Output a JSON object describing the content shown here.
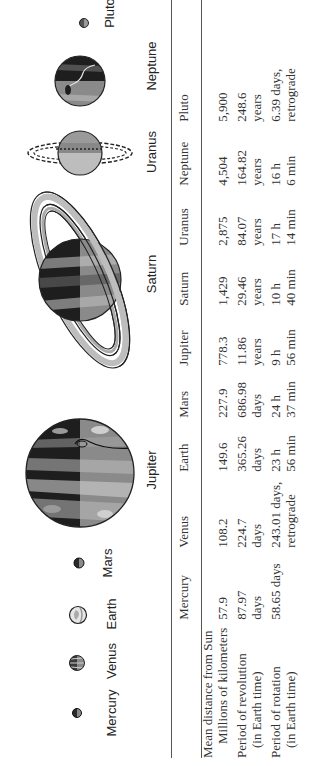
{
  "diagram": {
    "title_labels": {
      "mercury": "Mercury",
      "venus": "Venus",
      "earth": "Earth",
      "mars": "Mars",
      "jupiter": "Jupiter",
      "saturn": "Saturn",
      "uranus": "Uranus",
      "neptune": "Neptune",
      "pluto": "Pluto"
    },
    "orientation": "rotated 90 degrees counter-clockwise"
  },
  "table": {
    "columns": [
      "",
      "Mercury",
      "Venus",
      "Earth",
      "Mars",
      "Jupiter",
      "Saturn",
      "Uranus",
      "Neptune",
      "Pluto"
    ],
    "rows": [
      {
        "label_line1": "Mean distance from Sun",
        "label_line2": "Millions of kilometers",
        "values": [
          {
            "l1": "57.9",
            "l2": ""
          },
          {
            "l1": "108.2",
            "l2": ""
          },
          {
            "l1": "149.6",
            "l2": ""
          },
          {
            "l1": "227.9",
            "l2": ""
          },
          {
            "l1": "778.3",
            "l2": ""
          },
          {
            "l1": "1,429",
            "l2": ""
          },
          {
            "l1": "2,875",
            "l2": ""
          },
          {
            "l1": "4,504",
            "l2": ""
          },
          {
            "l1": "5,900",
            "l2": ""
          }
        ]
      },
      {
        "label_line1": "Period of revolution",
        "label_line2": "(in Earth time)",
        "values": [
          {
            "l1": "87.97",
            "l2": "days"
          },
          {
            "l1": "224.7",
            "l2": "days"
          },
          {
            "l1": "365.26",
            "l2": "days"
          },
          {
            "l1": "686.98",
            "l2": "days"
          },
          {
            "l1": "11.86",
            "l2": "years"
          },
          {
            "l1": "29.46",
            "l2": "years"
          },
          {
            "l1": "84.07",
            "l2": "years"
          },
          {
            "l1": "164.82",
            "l2": "years"
          },
          {
            "l1": "248.6",
            "l2": "years"
          }
        ]
      },
      {
        "label_line1": "Period of rotation",
        "label_line2": "(in Earth time)",
        "values": [
          {
            "l1": "58.65 days",
            "l2": ""
          },
          {
            "l1": "243.01 days,",
            "l2": "retrograde"
          },
          {
            "l1": "23 h",
            "l2": "56 min"
          },
          {
            "l1": "24 h",
            "l2": "37 min"
          },
          {
            "l1": "9 h",
            "l2": "56 min"
          },
          {
            "l1": "10 h",
            "l2": "40 min"
          },
          {
            "l1": "17 h",
            "l2": "14 min"
          },
          {
            "l1": "16 h",
            "l2": "6 min"
          },
          {
            "l1": "6.39 days,",
            "l2": "retrograde"
          }
        ]
      }
    ]
  },
  "colors": {
    "rule": "#555555",
    "ink": "#222222",
    "dark_band": "#2a2a2a",
    "mid_band": "#777777",
    "light_band": "#bdbdbd"
  }
}
